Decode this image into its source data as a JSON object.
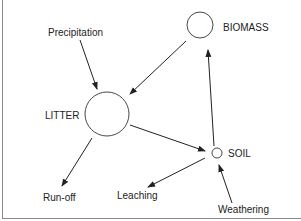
{
  "diagram": {
    "type": "nutrient-cycle flow diagram",
    "nodes": [
      {
        "id": "biomass",
        "label": "BIOMASS",
        "size": "medium"
      },
      {
        "id": "litter",
        "label": "LITTER",
        "size": "large"
      },
      {
        "id": "soil",
        "label": "SOIL",
        "size": "small"
      }
    ],
    "external": [
      {
        "id": "precipitation",
        "label": "Precipitation"
      },
      {
        "id": "runoff",
        "label": "Run-off"
      },
      {
        "id": "leaching",
        "label": "Leaching"
      },
      {
        "id": "weathering",
        "label": "Weathering"
      }
    ],
    "edges": [
      {
        "from": "precipitation",
        "to": "litter"
      },
      {
        "from": "biomass",
        "to": "litter"
      },
      {
        "from": "litter",
        "to": "soil"
      },
      {
        "from": "soil",
        "to": "biomass"
      },
      {
        "from": "litter",
        "to": "runoff"
      },
      {
        "from": "soil",
        "to": "leaching"
      },
      {
        "from": "weathering",
        "to": "soil"
      }
    ],
    "colors": {
      "stroke": "#222222",
      "frame": "#8a8a8a",
      "background": "#ffffff"
    }
  }
}
